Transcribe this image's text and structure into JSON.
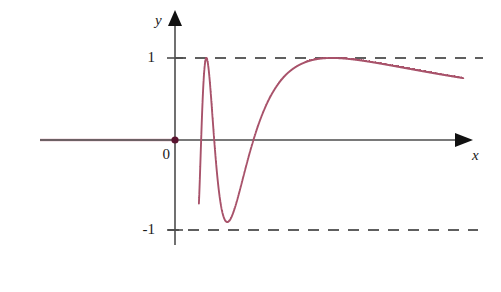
{
  "chart_data": {
    "type": "line",
    "title": "",
    "subtitle": "",
    "xlabel": "x",
    "ylabel": "y",
    "function": "y = sin(1/x)",
    "xlim": [
      0,
      1.25
    ],
    "ylim": [
      -1.35,
      1.35
    ],
    "grid": false,
    "legend_position": "none",
    "y_tick_labels": [
      "1",
      "0",
      "-1"
    ],
    "y_tick_values": [
      1,
      0,
      -1
    ],
    "x_tick_labels": [],
    "x_tick_values": [],
    "annotations": [
      {
        "name": "upper-envelope",
        "type": "dashed-horizontal",
        "y": 1
      },
      {
        "name": "lower-envelope",
        "type": "dashed-horizontal",
        "y": -1
      },
      {
        "name": "origin-point",
        "type": "point",
        "x": 0,
        "y": 0
      }
    ],
    "series": [
      {
        "name": "sin(1/x)",
        "color": "#a8526a",
        "x": [
          0.0,
          0.025,
          0.05,
          0.07,
          0.085,
          0.095,
          0.102,
          0.108,
          0.114,
          0.12,
          0.126,
          0.132,
          0.138,
          0.143,
          0.147,
          0.151,
          0.155,
          0.16,
          0.166,
          0.172,
          0.178,
          0.184,
          0.19,
          0.196,
          0.202,
          0.208,
          0.214,
          0.22,
          0.228,
          0.236,
          0.244,
          0.252,
          0.26,
          0.268,
          0.276,
          0.284,
          0.292,
          0.3,
          0.31,
          0.32,
          0.33,
          0.34,
          0.35,
          0.362,
          0.374,
          0.386,
          0.398,
          0.41,
          0.424,
          0.438,
          0.452,
          0.466,
          0.48,
          0.496,
          0.512,
          0.528,
          0.544,
          0.56,
          0.58,
          0.6,
          0.62,
          0.64,
          0.66,
          0.68,
          0.7,
          0.725,
          0.75,
          0.775,
          0.8,
          0.83,
          0.86,
          0.89,
          0.92,
          0.95,
          0.98,
          1.01,
          1.04,
          1.07,
          1.1,
          1.13,
          1.16,
          1.19,
          1.22,
          1.25
        ],
        "y": [
          0.0,
          0.0,
          0.0,
          0.0,
          0.0,
          0.0,
          0.0,
          0.0,
          0.0,
          0.0,
          0.0,
          0.0,
          0.0,
          0.0,
          0.0,
          0.0,
          0.0,
          0.0,
          0.0,
          0.0,
          0.0,
          0.0,
          0.0,
          0.0,
          0.0,
          0.0,
          0.0,
          0.0,
          0.0,
          0.0,
          0.0,
          0.0,
          0.0,
          0.0,
          0.0,
          0.0,
          0.0,
          0.0,
          0.0,
          0.0,
          0.0,
          0.0,
          0.0,
          0.0,
          0.0,
          0.0,
          0.0,
          0.0,
          0.0,
          0.0,
          0.0,
          0.0,
          0.0,
          0.0,
          0.0,
          0.0,
          0.0,
          0.0,
          0.0,
          0.0,
          0.0,
          0.0,
          0.0,
          0.0,
          0.0,
          0.0,
          0.0,
          0.0,
          0.0,
          0.0,
          0.0,
          0.0,
          0.0,
          0.0,
          0.0,
          0.0,
          0.0,
          0.0,
          0.0,
          0.0,
          0.0,
          0.0,
          0.0,
          0.0
        ],
        "note": "y values are computed as sin(1/x) by the renderer; the sampled list is a placeholder grid."
      }
    ]
  },
  "colors": {
    "curve": "#a8526a",
    "curve_faint": "#cf9aaa",
    "axis": "#4d4d4d",
    "dashed": "#2b2b2b",
    "text": "#1a1a1a",
    "background": "#ffffff"
  },
  "labels": {
    "y_axis": "y",
    "x_axis": "x",
    "y_one": "1",
    "y_zero": "0",
    "y_negative_one": "-1"
  }
}
